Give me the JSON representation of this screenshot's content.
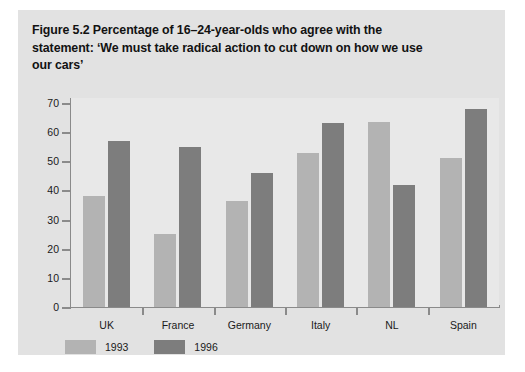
{
  "figure": {
    "title": "Figure 5.2  Percentage of 16–24-year-olds who agree with the statement: ‘We must take radical action to cut down on how we use our cars’"
  },
  "colors": {
    "panel_background": "#e2e2e2",
    "plot_background": "#e8e8e8",
    "axis": "#8a8a8a",
    "series_1993": "#b3b3b3",
    "series_1996": "#7d7d7d",
    "text": "#1a1a1a"
  },
  "chart_data": {
    "type": "bar",
    "title": "Figure 5.2  Percentage of 16–24-year-olds who agree with the statement: ‘We must take radical action to cut down on how we use our cars’",
    "xlabel": "",
    "ylabel": "",
    "ylim": [
      0,
      70
    ],
    "yticks": [
      0,
      10,
      20,
      30,
      40,
      50,
      60,
      70
    ],
    "ytick_labels": [
      "0",
      "10",
      "20",
      "30",
      "40",
      "50",
      "60",
      "70"
    ],
    "grid": false,
    "legend_position": "bottom-left",
    "categories": [
      "UK",
      "France",
      "Germany",
      "Italy",
      "NL",
      "Spain"
    ],
    "series": [
      {
        "name": "1993",
        "color": "#b3b3b3",
        "values": [
          38,
          25,
          36.5,
          53,
          63.5,
          51
        ]
      },
      {
        "name": "1996",
        "color": "#7d7d7d",
        "values": [
          57,
          55,
          46,
          63,
          42,
          68
        ]
      }
    ]
  }
}
